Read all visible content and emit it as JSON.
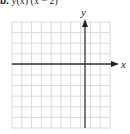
{
  "header": {
    "part_label": "b.",
    "equation_fragment": "y(x)          (x − 2)"
  },
  "chart_data": {
    "type": "scatter",
    "title": "",
    "xlabel": "x",
    "ylabel": "y",
    "grid": true,
    "grid_columns": 10,
    "grid_rows": 10,
    "x_axis_column_index": 7,
    "y_axis_row_index": 4,
    "series": [],
    "note": "Blank coordinate grid with arrowed x and y axes; no plotted data or tick labels."
  },
  "colors": {
    "grid_line": "#d9d9d9",
    "axis": "#333333",
    "text": "#222222"
  }
}
